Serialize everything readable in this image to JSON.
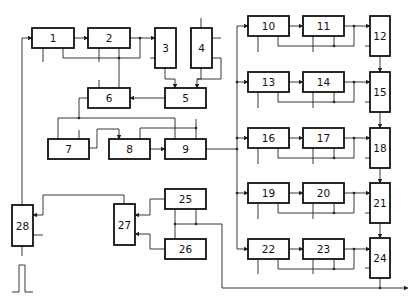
{
  "diagram": {
    "type": "block-diagram",
    "blocks": [
      {
        "id": "1",
        "label": "1"
      },
      {
        "id": "2",
        "label": "2"
      },
      {
        "id": "3",
        "label": "3"
      },
      {
        "id": "4",
        "label": "4"
      },
      {
        "id": "5",
        "label": "5"
      },
      {
        "id": "6",
        "label": "6"
      },
      {
        "id": "7",
        "label": "7"
      },
      {
        "id": "8",
        "label": "8"
      },
      {
        "id": "9",
        "label": "9"
      },
      {
        "id": "10",
        "label": "10"
      },
      {
        "id": "11",
        "label": "11"
      },
      {
        "id": "12",
        "label": "12"
      },
      {
        "id": "13",
        "label": "13"
      },
      {
        "id": "14",
        "label": "14"
      },
      {
        "id": "15",
        "label": "15"
      },
      {
        "id": "16",
        "label": "16"
      },
      {
        "id": "17",
        "label": "17"
      },
      {
        "id": "18",
        "label": "18"
      },
      {
        "id": "19",
        "label": "19"
      },
      {
        "id": "20",
        "label": "20"
      },
      {
        "id": "21",
        "label": "21"
      },
      {
        "id": "22",
        "label": "22"
      },
      {
        "id": "23",
        "label": "23"
      },
      {
        "id": "24",
        "label": "24"
      },
      {
        "id": "25",
        "label": "25"
      },
      {
        "id": "26",
        "label": "26"
      },
      {
        "id": "27",
        "label": "27"
      },
      {
        "id": "28",
        "label": "28"
      }
    ],
    "colors": {
      "stroke": "#111111",
      "background": "#ffffff"
    },
    "pulse_symbol": "single-rectangular-pulse"
  }
}
